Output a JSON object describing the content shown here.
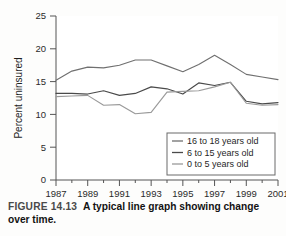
{
  "figure": {
    "number_label": "FIGURE 14.13",
    "caption_text": "A typical line graph showing change over time."
  },
  "chart_data": {
    "type": "line",
    "title": "",
    "xlabel": "",
    "ylabel": "Percent uninsured",
    "ylim": [
      0,
      25
    ],
    "xlim": [
      1987,
      2001
    ],
    "yticks": [
      0,
      5,
      10,
      15,
      20,
      25
    ],
    "ytick_labels": [
      "0",
      "5",
      "10",
      "15",
      "20",
      "25"
    ],
    "x": [
      1987,
      1988,
      1989,
      1990,
      1991,
      1992,
      1993,
      1994,
      1995,
      1996,
      1997,
      1998,
      1999,
      2000,
      2001
    ],
    "xticks": [
      1987,
      1989,
      1991,
      1993,
      1995,
      1997,
      1999,
      2001
    ],
    "xtick_labels": [
      "1987",
      "1989",
      "1991",
      "1993",
      "1995",
      "1997",
      "1999",
      "2001"
    ],
    "grid": false,
    "legend_position": "lower right",
    "series": [
      {
        "name": "16 to 18 years old",
        "color": "#707070",
        "values": [
          15.2,
          16.6,
          17.2,
          17.1,
          17.5,
          18.3,
          18.3,
          17.4,
          16.5,
          17.6,
          19.0,
          17.6,
          16.1,
          15.7,
          15.3
        ]
      },
      {
        "name": "6 to 15 years old",
        "color": "#4a4a4a",
        "values": [
          13.2,
          13.2,
          13.1,
          13.6,
          12.9,
          13.2,
          14.2,
          13.9,
          13.1,
          14.8,
          14.4,
          14.9,
          12.0,
          11.6,
          11.8
        ]
      },
      {
        "name": "0 to 5 years old",
        "color": "#9a9a9a",
        "values": [
          12.7,
          12.8,
          12.9,
          11.4,
          11.5,
          10.1,
          10.3,
          13.4,
          13.5,
          13.6,
          14.2,
          14.9,
          11.7,
          11.4,
          11.5
        ]
      }
    ]
  },
  "legend": {
    "items": [
      {
        "label": "16 to 18 years old",
        "color": "#707070"
      },
      {
        "label": "6 to 15 years old",
        "color": "#4a4a4a"
      },
      {
        "label": "0 to 5 years old",
        "color": "#9a9a9a"
      }
    ]
  }
}
